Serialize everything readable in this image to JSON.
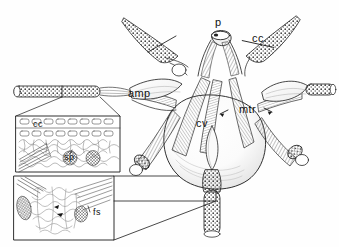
{
  "figure": {
    "type": "anatomical-line-drawing",
    "background_color": "#fefefe",
    "ink_color": "#1a1a1a",
    "labels": {
      "p": "p",
      "cc_main": "cc",
      "amp": "amp",
      "mtr": "mtr",
      "cv": "cv",
      "cc_inset": "cc",
      "sp": "sp",
      "fs": "fs"
    },
    "insets": [
      {
        "name": "upper-inset",
        "labels": [
          "cc",
          "sp"
        ],
        "x": 16,
        "y": 116,
        "w": 104,
        "h": 56
      },
      {
        "name": "lower-inset",
        "labels": [
          "fs"
        ],
        "x": 14,
        "y": 176,
        "w": 100,
        "h": 64
      }
    ],
    "structures": [
      "central vesicle",
      "ampulla",
      "pedicel",
      "cuticular cone",
      "muscle tracts",
      "sperm bundle tube",
      "tapered spines"
    ]
  }
}
